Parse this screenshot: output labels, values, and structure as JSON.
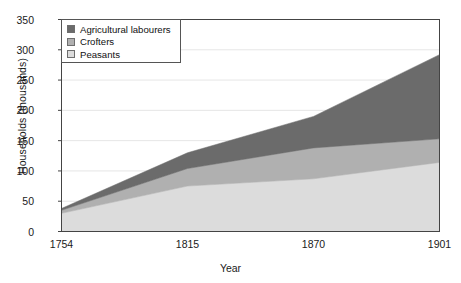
{
  "chart_data": {
    "type": "area",
    "stacked": true,
    "title": "",
    "xlabel": "Year",
    "ylabel": "Households (thousands)",
    "categories": [
      "1754",
      "1815",
      "1870",
      "1901"
    ],
    "x": [
      1754,
      1815,
      1870,
      1901
    ],
    "xtick_labels": [
      "1754",
      "1815",
      "1870",
      "1901"
    ],
    "ytick_labels": [
      "0",
      "50",
      "100",
      "150",
      "200",
      "250",
      "300",
      "350"
    ],
    "yticks": [
      0,
      50,
      100,
      150,
      200,
      250,
      300,
      350
    ],
    "ylim": [
      0,
      350
    ],
    "grid": true,
    "grid_axis": "y",
    "legend_position": "top-left",
    "series": [
      {
        "name": "Peasants",
        "color": "#dcdcdc",
        "values": [
          30,
          75,
          87,
          114
        ]
      },
      {
        "name": "Crofters",
        "color": "#b0b0b0",
        "values": [
          5,
          29,
          51,
          39
        ]
      },
      {
        "name": "Agricultural labourers",
        "color": "#6b6b6b",
        "values": [
          3,
          26,
          52,
          139
        ]
      }
    ],
    "series_stack_order_bottom_to_top": [
      "Peasants",
      "Crofters",
      "Agricultural labourers"
    ],
    "cumulative_totals": [
      38,
      130,
      190,
      292
    ]
  },
  "legend": {
    "entries": [
      {
        "label": "Agricultural labourers",
        "color": "#6b6b6b"
      },
      {
        "label": "Crofters",
        "color": "#b0b0b0"
      },
      {
        "label": "Peasants",
        "color": "#dcdcdc"
      }
    ]
  },
  "axes": {
    "x_title": "Year",
    "y_title": "Households (thousands)"
  },
  "colors": {
    "axis": "#444444",
    "grid": "#e6e6e6",
    "text": "#1a1a1a",
    "background": "#ffffff"
  }
}
